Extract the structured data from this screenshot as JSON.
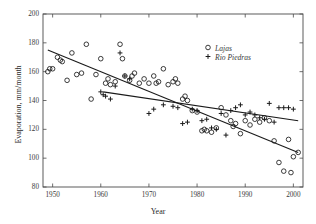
{
  "chart_data": {
    "type": "scatter",
    "title": "",
    "xlabel": "Year",
    "ylabel": "Evaporation, mm/month",
    "xlim": [
      1948,
      2002
    ],
    "ylim": [
      80,
      200
    ],
    "xticks": [
      1950,
      1960,
      1970,
      1980,
      1990,
      2000
    ],
    "yticks": [
      80,
      100,
      120,
      140,
      160,
      180,
      200
    ],
    "grid": false,
    "legend_position": "upper-right",
    "series": [
      {
        "name": "Lajas",
        "marker": "open-circle",
        "color": "#222222",
        "points": [
          [
            1949,
            160
          ],
          [
            1949.4,
            162
          ],
          [
            1950,
            162
          ],
          [
            1951,
            170
          ],
          [
            1951.6,
            168
          ],
          [
            1952,
            167
          ],
          [
            1953,
            154
          ],
          [
            1954,
            173
          ],
          [
            1955,
            158
          ],
          [
            1956,
            159
          ],
          [
            1957,
            179
          ],
          [
            1958,
            141
          ],
          [
            1959,
            158
          ],
          [
            1960,
            169
          ],
          [
            1961,
            152
          ],
          [
            1961.5,
            155
          ],
          [
            1962,
            151
          ],
          [
            1963,
            153
          ],
          [
            1964,
            179
          ],
          [
            1964.5,
            169
          ],
          [
            1965,
            157
          ],
          [
            1966,
            154
          ],
          [
            1966.5,
            157
          ],
          [
            1967,
            159
          ],
          [
            1968,
            152
          ],
          [
            1969,
            155
          ],
          [
            1970,
            152
          ],
          [
            1971,
            157
          ],
          [
            1971.5,
            152
          ],
          [
            1972,
            153
          ],
          [
            1973,
            162
          ],
          [
            1974,
            151
          ],
          [
            1975,
            153
          ],
          [
            1975.5,
            155
          ],
          [
            1976,
            152
          ],
          [
            1977,
            141
          ],
          [
            1977.5,
            143
          ],
          [
            1978,
            140
          ],
          [
            1979,
            133
          ],
          [
            1980,
            132
          ],
          [
            1981,
            119
          ],
          [
            1981.5,
            120
          ],
          [
            1982,
            119
          ],
          [
            1983,
            118
          ],
          [
            1984,
            121
          ],
          [
            1985,
            135
          ],
          [
            1986,
            130
          ],
          [
            1987,
            126
          ],
          [
            1987.5,
            122
          ],
          [
            1988,
            124
          ],
          [
            1989,
            117
          ],
          [
            1990,
            126
          ],
          [
            1991,
            123
          ],
          [
            1992,
            127
          ],
          [
            1993,
            125
          ],
          [
            1994,
            128
          ],
          [
            1995,
            126
          ],
          [
            1996,
            112
          ],
          [
            1997,
            97
          ],
          [
            1998,
            91
          ],
          [
            1999,
            113
          ],
          [
            1999.5,
            90
          ],
          [
            2000,
            101
          ],
          [
            2001,
            104
          ]
        ]
      },
      {
        "name": "Rio Piedras",
        "marker": "plus",
        "color": "#222222",
        "points": [
          [
            1960,
            146
          ],
          [
            1960.5,
            144
          ],
          [
            1961,
            143
          ],
          [
            1962,
            141
          ],
          [
            1963,
            150
          ],
          [
            1964,
            173
          ],
          [
            1965,
            157
          ],
          [
            1966,
            155
          ],
          [
            1970,
            131
          ],
          [
            1971,
            134
          ],
          [
            1973,
            137
          ],
          [
            1975,
            136
          ],
          [
            1976,
            135
          ],
          [
            1977,
            124
          ],
          [
            1978,
            125
          ],
          [
            1979,
            134
          ],
          [
            1980,
            133
          ],
          [
            1981,
            126
          ],
          [
            1982,
            127
          ],
          [
            1983,
            121
          ],
          [
            1984,
            120
          ],
          [
            1985,
            131
          ],
          [
            1986,
            116
          ],
          [
            1987,
            133
          ],
          [
            1988,
            135
          ],
          [
            1989,
            137
          ],
          [
            1990,
            130
          ],
          [
            1991,
            132
          ],
          [
            1992,
            130
          ],
          [
            1993,
            128
          ],
          [
            1994,
            127
          ],
          [
            1995,
            138
          ],
          [
            1996,
            125
          ],
          [
            1997,
            135
          ],
          [
            1998,
            135
          ],
          [
            1999,
            135
          ],
          [
            2000,
            134
          ]
        ]
      }
    ],
    "trend_lines": [
      {
        "name": "Lajas trend",
        "x": [
          1949,
          2001
        ],
        "y": [
          175,
          104
        ]
      },
      {
        "name": "Rio Piedras trend",
        "x": [
          1960.5,
          2001
        ],
        "y": [
          146,
          126
        ]
      }
    ]
  },
  "legend": {
    "items": [
      {
        "label": "Lajas",
        "marker": "open-circle"
      },
      {
        "label": "Rio Piedras",
        "marker": "plus"
      }
    ]
  },
  "axes": {
    "x_title": "Year",
    "y_title": "Evaporation, mm/month",
    "x_tick_labels": [
      "1950",
      "1960",
      "1970",
      "1980",
      "1990",
      "2000"
    ],
    "y_tick_labels": [
      "80",
      "100",
      "120",
      "140",
      "160",
      "180",
      "200"
    ]
  }
}
